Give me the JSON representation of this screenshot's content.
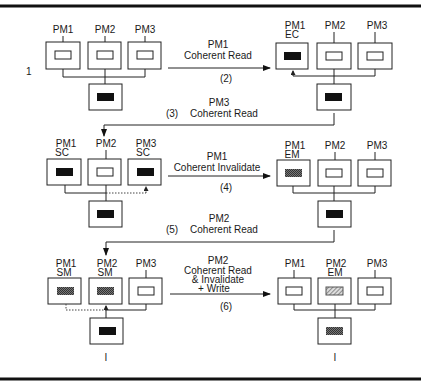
{
  "figure": {
    "row_label": "1",
    "colors": {
      "modified": "#111111",
      "shared": "#555555",
      "stroke": "#222222",
      "background": "#ffffff"
    }
  },
  "states": {
    "s1": {
      "processors": [
        {
          "name": "PM1",
          "state": "I",
          "cache": "empty"
        },
        {
          "name": "PM2",
          "state": "I",
          "cache": "empty"
        },
        {
          "name": "PM3",
          "state": "I",
          "cache": "empty"
        }
      ],
      "memory": "black"
    },
    "s2": {
      "processors": [
        {
          "name": "PM1",
          "state": "EC",
          "cache": "black"
        },
        {
          "name": "PM2",
          "state": "I",
          "cache": "empty"
        },
        {
          "name": "PM3",
          "state": "I",
          "cache": "empty"
        }
      ],
      "memory": "black"
    },
    "s3": {
      "processors": [
        {
          "name": "PM1",
          "state": "SC",
          "cache": "black"
        },
        {
          "name": "PM2",
          "state": "I",
          "cache": "empty"
        },
        {
          "name": "PM3",
          "state": "SC",
          "cache": "black"
        }
      ],
      "memory": "black"
    },
    "s4": {
      "processors": [
        {
          "name": "PM1",
          "state": "EM",
          "cache": "gray"
        },
        {
          "name": "PM2",
          "state": "I",
          "cache": "empty"
        },
        {
          "name": "PM3",
          "state": "I",
          "cache": "empty"
        }
      ],
      "memory": "black"
    },
    "s5": {
      "processors": [
        {
          "name": "PM1",
          "state": "SM",
          "cache": "gray"
        },
        {
          "name": "PM2",
          "state": "SM",
          "cache": "gray"
        },
        {
          "name": "PM3",
          "state": "I",
          "cache": "empty"
        }
      ],
      "memory": "black",
      "memory_state": "I"
    },
    "s6": {
      "processors": [
        {
          "name": "PM1",
          "state": "I",
          "cache": "empty"
        },
        {
          "name": "PM2",
          "state": "EM",
          "cache": "hatched"
        },
        {
          "name": "PM3",
          "state": "I",
          "cache": "empty"
        }
      ],
      "memory": "gray",
      "memory_state": "I"
    }
  },
  "transitions": [
    {
      "step": "(2)",
      "line1": "PM1",
      "line2": "Coherent Read"
    },
    {
      "step": "(3)",
      "line1": "PM3",
      "line2": "Coherent Read"
    },
    {
      "step": "(4)",
      "line1": "PM1",
      "line2": "Coherent Invalidate"
    },
    {
      "step": "(5)",
      "line1": "PM2",
      "line2": "Coherent Read"
    },
    {
      "step": "(6)",
      "line1": "PM2",
      "line2": "Coherent Read",
      "line3": "& Invalidate",
      "line4": "+ Write"
    }
  ]
}
